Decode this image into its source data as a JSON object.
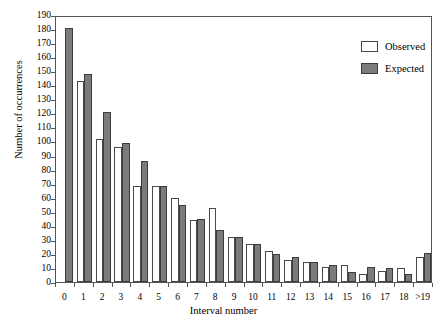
{
  "chart_data": {
    "type": "bar",
    "title": "",
    "xlabel": "Interval number",
    "ylabel": "Number of occurrences",
    "categories": [
      "0",
      "1",
      "2",
      "3",
      "4",
      "5",
      "6",
      "7",
      "8",
      "9",
      "10",
      "11",
      "12",
      "13",
      "14",
      "15",
      "16",
      "17",
      "18",
      ">19"
    ],
    "series": [
      {
        "name": "Observed",
        "color": "#ffffff",
        "values": [
          0,
          143,
          102,
          96,
          68,
          68,
          60,
          44,
          53,
          32,
          27,
          22,
          16,
          14,
          11,
          12,
          6,
          8,
          10,
          18
        ]
      },
      {
        "name": "Expected",
        "color": "#7b7b7b",
        "values": [
          181,
          148,
          121,
          99,
          86,
          68,
          55,
          45,
          37,
          32,
          27,
          20,
          18,
          14,
          12,
          7,
          11,
          10,
          6,
          21
        ]
      }
    ],
    "ylim": [
      0,
      190
    ],
    "ytick_step": 10,
    "yticks": [
      0,
      10,
      20,
      30,
      40,
      50,
      60,
      70,
      80,
      90,
      100,
      110,
      120,
      130,
      140,
      150,
      160,
      170,
      180,
      190
    ],
    "grid": false,
    "legend_position": "top-right",
    "legend_entries": [
      "Observed",
      "Expected"
    ]
  }
}
